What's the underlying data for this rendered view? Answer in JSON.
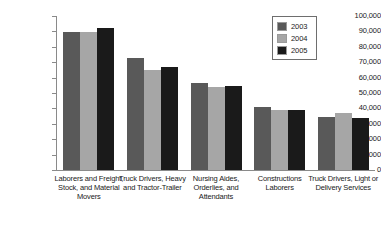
{
  "chart_data": {
    "type": "bar",
    "title": "",
    "xlabel": "",
    "ylabel": "",
    "ylim": [
      0,
      100000
    ],
    "grid": false,
    "legend_position": "top-right",
    "ytick_labels": [
      "100,000",
      "90,000",
      "80,000",
      "70,000",
      "60,000",
      "50,000",
      "40,000",
      "30,000",
      "20,000",
      "10,000",
      "0"
    ],
    "ytick_values": [
      100000,
      90000,
      80000,
      70000,
      60000,
      50000,
      40000,
      30000,
      20000,
      10000,
      0
    ],
    "categories": [
      "Laborers and Freight, Stock, and Material Movers",
      "Truck Drivers, Heavy and Tractor-Trailer",
      "Nursing Aides, Orderlies, and Attendants",
      "Constructions Laborers",
      "Truck Drivers, Light or Delivery Services"
    ],
    "series": [
      {
        "name": "2003",
        "color": "#595959",
        "values": [
          89600,
          72700,
          56500,
          40900,
          34400
        ]
      },
      {
        "name": "2004",
        "color": "#a6a6a6",
        "values": [
          89600,
          64900,
          53900,
          39000,
          37000
        ]
      },
      {
        "name": "2005",
        "color": "#1a1a1a",
        "values": [
          92200,
          66900,
          54500,
          39000,
          34000
        ]
      }
    ]
  },
  "legend": {
    "items": [
      {
        "label": "2003",
        "swatch": "#595959"
      },
      {
        "label": "2004",
        "swatch": "#a6a6a6"
      },
      {
        "label": "2005",
        "swatch": "#1a1a1a"
      }
    ]
  },
  "axis": {
    "line_color": "#8a8a8a"
  }
}
